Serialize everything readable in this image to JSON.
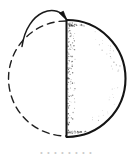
{
  "figure": {
    "title": "Sphere with rotating half-disc and curved motion arrow",
    "medium": "hand-drawn ink line drawing",
    "background_color": "#ffffff",
    "ink_color": "#1a1a1a",
    "canvas": {
      "width": 133,
      "height": 155
    },
    "parts": {
      "ghost_circle_label": "dashed circle outline (previous position)",
      "solid_half_disc_label": "solid shaded half-disc (current position)",
      "diameter_edge_label": "vertical straight diameter edge",
      "stipple_label": "stippled shading dots",
      "rotation_arrow_label": "curved rotation arrow"
    }
  },
  "geometry": {
    "circle": {
      "cx": 66,
      "cy": 78.5,
      "r": 57.5
    },
    "dashed_arc": {
      "start": {
        "x": 66,
        "y": 21
      },
      "end": {
        "x": 66,
        "y": 136
      },
      "sweep": "left",
      "dash_pattern": "7 5",
      "stroke_width": 1.4
    },
    "solid_arc": {
      "start": {
        "x": 67,
        "y": 20
      },
      "end": {
        "x": 67,
        "y": 137
      },
      "sweep": "right",
      "stroke_width": 2.1
    },
    "diameter_line": {
      "x": 66.5,
      "y_top": 20,
      "y_bottom": 137,
      "stroke_width": 2.0
    },
    "arrow": {
      "tail": {
        "x": 22,
        "y": 46.5
      },
      "control_one": {
        "x": 27,
        "y": 10
      },
      "control_two": {
        "x": 58,
        "y": 1
      },
      "head": {
        "x": 67,
        "y": 20.5
      },
      "head_angle_deg": 62,
      "head_length": 10,
      "stroke_width": 1.5
    }
  },
  "stipple": {
    "dot_color": "#3a3a3a",
    "edge_band_count": 150,
    "corner_cluster_count": 70,
    "interior_count": 40,
    "seed": 20240917
  },
  "caption": {
    "text": "• • • • • • • •",
    "visible": true,
    "note": "caption row is cropped by the bottom image edge and is illegible"
  }
}
